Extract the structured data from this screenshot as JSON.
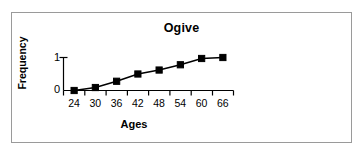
{
  "chart_data": {
    "type": "line",
    "title": "Ogive",
    "xlabel": "Ages",
    "ylabel": "Frequency",
    "categories": [
      "24",
      "30",
      "36",
      "42",
      "48",
      "54",
      "60",
      "66"
    ],
    "values": [
      0,
      0.09,
      0.28,
      0.5,
      0.62,
      0.78,
      0.97,
      1.0
    ],
    "ylim": [
      0,
      1
    ],
    "yticks": [
      "0",
      "1"
    ],
    "ytick_values": [
      0,
      1
    ],
    "grid": false,
    "legend": false,
    "marker": "filled-square",
    "series_color": "#000000",
    "background_color": "#ffffff",
    "border_color": "#9a9a9a"
  }
}
